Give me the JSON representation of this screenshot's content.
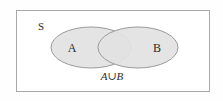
{
  "figure": {
    "type": "venn-diagram",
    "canvas": {
      "width": 223,
      "height": 101
    },
    "background_color": "#fefefe"
  },
  "universe": {
    "label": "S",
    "border_color": "#a8a8a8",
    "fill_color": "#ffffff",
    "rect": {
      "x": 16,
      "y": 10,
      "width": 194,
      "height": 82
    }
  },
  "sets": [
    {
      "id": "set-a",
      "label": "A",
      "fill_color": "#e2e2e2",
      "stroke_color": "#9a9a9a",
      "ellipse": {
        "cx": 91,
        "cy": 47.5,
        "rx": 40,
        "ry": 20.5
      },
      "label_position": {
        "x": 72,
        "y": 52
      }
    },
    {
      "id": "set-b",
      "label": "B",
      "fill_color": "#e2e2e2",
      "stroke_color": "#9a9a9a",
      "ellipse": {
        "cx": 138,
        "cy": 47.5,
        "rx": 40,
        "ry": 20.5
      },
      "label_position": {
        "x": 157,
        "y": 52
      }
    }
  ],
  "caption": {
    "left_operand": "A",
    "operator": "∪",
    "right_operand": "B",
    "full_text": "A∪B",
    "position": {
      "x": 112,
      "y": 80
    }
  },
  "shading": {
    "description": "Both sets fully shaded, representing the union A union B",
    "intersection_fill_color": "#dedede"
  }
}
